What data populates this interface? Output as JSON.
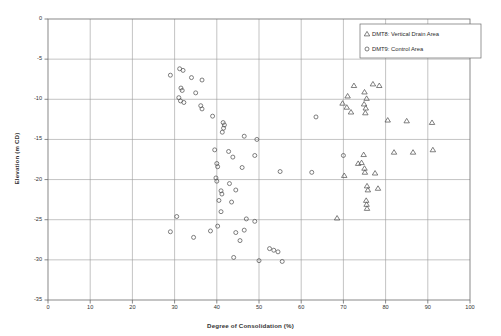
{
  "chart_data": {
    "type": "scatter",
    "title": "",
    "xlabel": "Degree of Consolidation (%)",
    "ylabel": "Elevation (m CD)",
    "xlim": [
      0,
      100
    ],
    "ylim": [
      -35,
      0
    ],
    "xticks": [
      0,
      10,
      20,
      30,
      40,
      50,
      60,
      70,
      80,
      90,
      100
    ],
    "yticks": [
      0,
      -5,
      -10,
      -15,
      -20,
      -25,
      -30,
      -35
    ],
    "grid": true,
    "legend_position": "top-right",
    "series": [
      {
        "name": "DMT8: Vertical Drain Area",
        "marker": "triangle",
        "color": "#555555",
        "points": [
          [
            72.5,
            -8.3
          ],
          [
            77.0,
            -8.1
          ],
          [
            78.5,
            -8.3
          ],
          [
            75.0,
            -9.1
          ],
          [
            71.0,
            -9.6
          ],
          [
            75.5,
            -9.9
          ],
          [
            69.8,
            -10.5
          ],
          [
            70.8,
            -11.0
          ],
          [
            74.9,
            -10.6
          ],
          [
            75.3,
            -11.1
          ],
          [
            71.8,
            -11.6
          ],
          [
            75.2,
            -11.7
          ],
          [
            80.5,
            -12.6
          ],
          [
            85.0,
            -12.7
          ],
          [
            91.0,
            -12.9
          ],
          [
            74.8,
            -16.9
          ],
          [
            82.0,
            -16.6
          ],
          [
            86.5,
            -16.6
          ],
          [
            91.2,
            -16.3
          ],
          [
            73.5,
            -18.0
          ],
          [
            74.3,
            -17.9
          ],
          [
            75.0,
            -18.6
          ],
          [
            75.1,
            -19.1
          ],
          [
            77.5,
            -19.2
          ],
          [
            70.2,
            -19.5
          ],
          [
            75.6,
            -20.8
          ],
          [
            75.8,
            -21.3
          ],
          [
            78.2,
            -21.1
          ],
          [
            75.4,
            -22.6
          ],
          [
            75.5,
            -23.1
          ],
          [
            75.6,
            -23.6
          ],
          [
            68.5,
            -24.8
          ]
        ]
      },
      {
        "name": "DMT9: Control Area",
        "marker": "circle",
        "color": "#555555",
        "points": [
          [
            31.2,
            -6.2
          ],
          [
            32.0,
            -6.4
          ],
          [
            29.0,
            -7.0
          ],
          [
            34.0,
            -7.3
          ],
          [
            36.5,
            -7.6
          ],
          [
            31.5,
            -8.6
          ],
          [
            31.8,
            -8.9
          ],
          [
            35.0,
            -9.2
          ],
          [
            31.0,
            -9.8
          ],
          [
            31.4,
            -10.2
          ],
          [
            32.2,
            -10.4
          ],
          [
            36.2,
            -10.8
          ],
          [
            36.5,
            -11.2
          ],
          [
            39.0,
            -12.1
          ],
          [
            41.5,
            -12.9
          ],
          [
            41.8,
            -13.2
          ],
          [
            41.6,
            -13.6
          ],
          [
            41.3,
            -14.1
          ],
          [
            46.5,
            -14.6
          ],
          [
            49.5,
            -15.0
          ],
          [
            39.5,
            -16.3
          ],
          [
            42.8,
            -16.5
          ],
          [
            43.8,
            -17.2
          ],
          [
            49.0,
            -17.0
          ],
          [
            40.0,
            -18.0
          ],
          [
            40.2,
            -18.4
          ],
          [
            46.0,
            -18.5
          ],
          [
            55.0,
            -19.0
          ],
          [
            62.5,
            -19.1
          ],
          [
            70.0,
            -17.0
          ],
          [
            63.5,
            -12.2
          ],
          [
            39.8,
            -19.8
          ],
          [
            40.0,
            -20.2
          ],
          [
            43.0,
            -20.5
          ],
          [
            41.0,
            -21.4
          ],
          [
            41.2,
            -21.8
          ],
          [
            44.5,
            -21.3
          ],
          [
            40.5,
            -22.6
          ],
          [
            43.5,
            -22.8
          ],
          [
            30.5,
            -24.6
          ],
          [
            29.0,
            -26.5
          ],
          [
            47.0,
            -24.9
          ],
          [
            49.0,
            -25.2
          ],
          [
            40.2,
            -25.8
          ],
          [
            34.5,
            -27.2
          ],
          [
            38.5,
            -26.4
          ],
          [
            44.5,
            -26.6
          ],
          [
            46.5,
            -26.3
          ],
          [
            45.5,
            -27.6
          ],
          [
            52.5,
            -28.6
          ],
          [
            53.5,
            -28.8
          ],
          [
            54.5,
            -29.0
          ],
          [
            44.0,
            -29.7
          ],
          [
            50.0,
            -30.1
          ],
          [
            55.5,
            -30.2
          ],
          [
            41.0,
            -24.0
          ]
        ]
      }
    ]
  },
  "legend": {
    "entries": [
      {
        "label": "DMT8: Vertical Drain Area",
        "marker": "triangle"
      },
      {
        "label": "DMT9: Control Area",
        "marker": "circle"
      }
    ]
  }
}
